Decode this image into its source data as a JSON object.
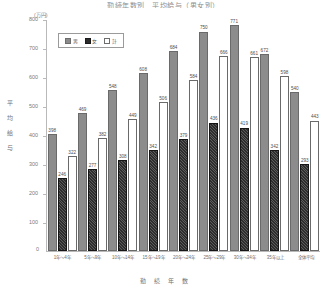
{
  "chart_data": {
    "type": "bar",
    "title": "勤続年数別　平均給与（男女別）",
    "unit": "(万円)",
    "xlabel": "勤続年数",
    "ylabel": "平均給与",
    "ylim": [
      0,
      800
    ],
    "yticks": [
      0,
      100,
      200,
      300,
      400,
      500,
      600,
      700,
      800
    ],
    "grid": false,
    "legend_position": "top-left",
    "categories": [
      "1年～4年",
      "5年～9年",
      "10年～14年",
      "15年～19年",
      "20年～24年",
      "25年～29年",
      "30年～34年",
      "35年以上",
      "全体平均"
    ],
    "series": [
      {
        "name": "男",
        "color": "#8c8c8c",
        "values": [
          398,
          469,
          548,
          608,
          684,
          750,
          771,
          672,
          540
        ]
      },
      {
        "name": "女",
        "color": "#2e2e2e",
        "values": [
          246,
          277,
          308,
          342,
          379,
          436,
          419,
          342,
          293
        ]
      },
      {
        "name": "計",
        "color": "#ffffff",
        "values": [
          322,
          382,
          449,
          506,
          584,
          666,
          661,
          598,
          443
        ]
      }
    ]
  },
  "legend": {
    "items": [
      {
        "label": "男",
        "swatch": "male-swatch"
      },
      {
        "label": "女",
        "swatch": "female-swatch"
      },
      {
        "label": "計",
        "swatch": "total-swatch"
      }
    ]
  },
  "axis": {
    "zero": "0"
  }
}
